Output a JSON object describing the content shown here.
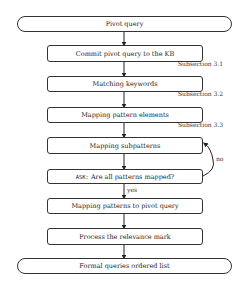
{
  "flowchart": {
    "start": "Pivot query",
    "steps": [
      "Commit pivot query to the KB",
      "Matching keywords",
      "Mapping pattern elements",
      "Mapping subpatterns"
    ],
    "decision": {
      "keyword": "ASK:",
      "question": "Are all patterns mapped?",
      "no_label": "no",
      "yes_label": "yes"
    },
    "post_steps": [
      "Mapping patterns to pivot query",
      "Process the relevance mark"
    ],
    "end": "Formal queries ordered list",
    "annotations": [
      "Subsection 3.1",
      "Subsection 3.2",
      "Subsection 3.3"
    ]
  }
}
